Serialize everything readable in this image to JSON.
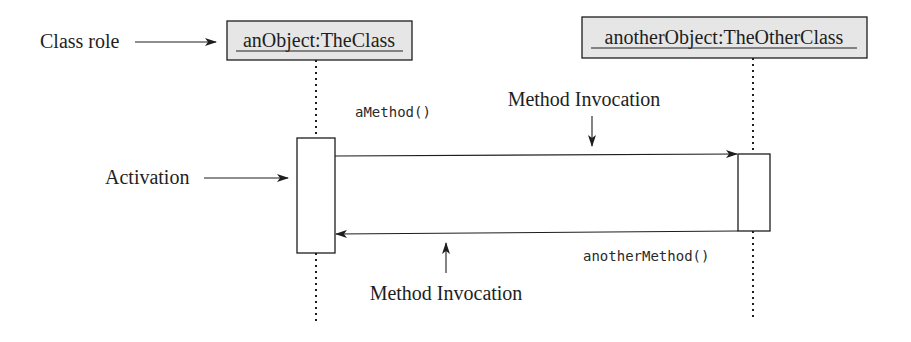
{
  "diagram": {
    "type": "UML sequence diagram",
    "colors": {
      "background": "#ffffff",
      "ink": "#1e1e1e",
      "object_box_fill": "#e6e6e6"
    },
    "objects": [
      {
        "id": "obj1",
        "label": "anObject:TheClass"
      },
      {
        "id": "obj2",
        "label": "anotherObject:TheOtherClass"
      }
    ],
    "messages": [
      {
        "label": "aMethod()",
        "from": "obj1",
        "to": "obj2"
      },
      {
        "label": "anotherMethod()",
        "from": "obj2",
        "to": "obj1"
      }
    ],
    "annotations": {
      "class_role": "Class role",
      "activation": "Activation",
      "method_invocation_top": "Method Invocation",
      "method_invocation_bottom": "Method Invocation"
    }
  }
}
